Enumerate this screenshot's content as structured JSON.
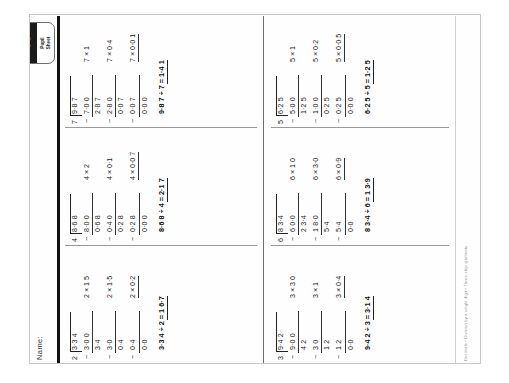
{
  "sheet": {
    "name_label": "Name:",
    "badge": {
      "number": "40",
      "caption_line1": "Pupil",
      "caption_line2": "Sheet"
    },
    "footer_left": "Decimals  •  Division by a single digit  •  Three-step  quotients",
    "footer_right": "New Heinemann Maths Y6, CM4\n© Pearson Education Limited\nPhotocopiable for classroom use only"
  },
  "problems": [
    {
      "id": "problem-1",
      "divisor": "2",
      "dividend": "3·3 4",
      "steps": [
        {
          "minus": "−",
          "value": "3·0 0",
          "underline": true,
          "side_mult": "2  ×  1 5",
          "side_underline": false
        },
        {
          "minus": "",
          "value": "3·4",
          "underline": false,
          "side_mult": "",
          "side_underline": false
        },
        {
          "minus": "−",
          "value": "3·0",
          "underline": true,
          "side_mult": "2  ×  1·5",
          "side_underline": false
        },
        {
          "minus": "",
          "value": "0·4",
          "underline": false,
          "side_mult": "",
          "side_underline": false
        },
        {
          "minus": "−",
          "value": "0·4",
          "underline": true,
          "side_mult": "2  ×  0·2",
          "side_underline": true
        },
        {
          "minus": "",
          "value": "0·0",
          "underline": false,
          "side_mult": "",
          "side_underline": false
        }
      ],
      "answer": "3·3 4  ÷  2  =  1 6·7",
      "quotient": "1 6·7"
    },
    {
      "id": "problem-2",
      "divisor": "4",
      "dividend": "8·6 8",
      "steps": [
        {
          "minus": "−",
          "value": "8·0 0",
          "underline": true,
          "side_mult": "4  ×  2",
          "side_underline": false
        },
        {
          "minus": "",
          "value": "0·6 8",
          "underline": false,
          "side_mult": "",
          "side_underline": false
        },
        {
          "minus": "−",
          "value": "0·4 0",
          "underline": true,
          "side_mult": "4  ×  0·1",
          "side_underline": false
        },
        {
          "minus": "",
          "value": "0·2 8",
          "underline": false,
          "side_mult": "",
          "side_underline": false
        },
        {
          "minus": "−",
          "value": "0·2 8",
          "underline": true,
          "side_mult": "4  ×  0·0 7",
          "side_underline": true
        },
        {
          "minus": "",
          "value": "0·0 0",
          "underline": false,
          "side_mult": "",
          "side_underline": false
        }
      ],
      "answer": "8·6 8  ÷  4  =  2·1 7",
      "quotient": "2·1 7"
    },
    {
      "id": "problem-3",
      "divisor": "7",
      "dividend": "9·8 7",
      "steps": [
        {
          "minus": "−",
          "value": "7·0 0",
          "underline": true,
          "side_mult": "7  ×  1",
          "side_underline": false
        },
        {
          "minus": "",
          "value": "2·8 7",
          "underline": false,
          "side_mult": "",
          "side_underline": false
        },
        {
          "minus": "−",
          "value": "2·8 0",
          "underline": true,
          "side_mult": "7  ×  0·4",
          "side_underline": false
        },
        {
          "minus": "",
          "value": "0·0 7",
          "underline": false,
          "side_mult": "",
          "side_underline": false
        },
        {
          "minus": "−",
          "value": "0·0 7",
          "underline": true,
          "side_mult": "7  ×  0·0 1",
          "side_underline": true
        },
        {
          "minus": "",
          "value": "0·0 0",
          "underline": false,
          "side_mult": "",
          "side_underline": false
        }
      ],
      "answer": "9·8 7  ÷  7  =  1·4 1",
      "quotient": "1·4 1"
    },
    {
      "id": "problem-4",
      "divisor": "3",
      "dividend": "9·4 2",
      "steps": [
        {
          "minus": "−",
          "value": "9·0 0",
          "underline": true,
          "side_mult": "3  ×  3 0",
          "side_underline": false
        },
        {
          "minus": "",
          "value": "4 2",
          "underline": false,
          "side_mult": "",
          "side_underline": false
        },
        {
          "minus": "−",
          "value": "3 0",
          "underline": true,
          "side_mult": "3  ×  1",
          "side_underline": false
        },
        {
          "minus": "",
          "value": "1 2",
          "underline": false,
          "side_mult": "",
          "side_underline": false
        },
        {
          "minus": "−",
          "value": "1 2",
          "underline": true,
          "side_mult": "3  ×  0·4",
          "side_underline": true
        },
        {
          "minus": "",
          "value": "0·0",
          "underline": false,
          "side_mult": "",
          "side_underline": false
        }
      ],
      "answer": "9·4 2  ÷  3  =  3·1 4",
      "quotient": "3·1 4"
    },
    {
      "id": "problem-5",
      "divisor": "6",
      "dividend": "8 3·4",
      "steps": [
        {
          "minus": "−",
          "value": "6 0·0",
          "underline": true,
          "side_mult": "6  ×  1 0",
          "side_underline": false
        },
        {
          "minus": "",
          "value": "2 3·4",
          "underline": false,
          "side_mult": "",
          "side_underline": false
        },
        {
          "minus": "−",
          "value": "1 8·0",
          "underline": true,
          "side_mult": "6  ×  3·0",
          "side_underline": false
        },
        {
          "minus": "",
          "value": "5·4",
          "underline": false,
          "side_mult": "",
          "side_underline": false
        },
        {
          "minus": "−",
          "value": "5·4",
          "underline": true,
          "side_mult": "6  ×  0·9",
          "side_underline": true
        },
        {
          "minus": "",
          "value": "0·0",
          "underline": false,
          "side_mult": "",
          "side_underline": false
        }
      ],
      "answer": "8 3·4  ÷  6  =  1 3·9",
      "quotient": "1 3·9"
    },
    {
      "id": "problem-6",
      "divisor": "5",
      "dividend": "6·2 5",
      "steps": [
        {
          "minus": "−",
          "value": "5·0 0",
          "underline": true,
          "side_mult": "5  ×  1",
          "side_underline": false
        },
        {
          "minus": "",
          "value": "1·2 5",
          "underline": false,
          "side_mult": "",
          "side_underline": false
        },
        {
          "minus": "−",
          "value": "1·0 0",
          "underline": true,
          "side_mult": "5  ×  0·2",
          "side_underline": false
        },
        {
          "minus": "",
          "value": "0·2 5",
          "underline": false,
          "side_mult": "",
          "side_underline": false
        },
        {
          "minus": "−",
          "value": "0·2 5",
          "underline": true,
          "side_mult": "5  ×  0·0 5",
          "side_underline": true
        },
        {
          "minus": "",
          "value": "0·0 0",
          "underline": false,
          "side_mult": "",
          "side_underline": false
        }
      ],
      "answer": "6·2 5  ÷  5  =  1·2 5",
      "quotient": "1·2 5"
    }
  ]
}
